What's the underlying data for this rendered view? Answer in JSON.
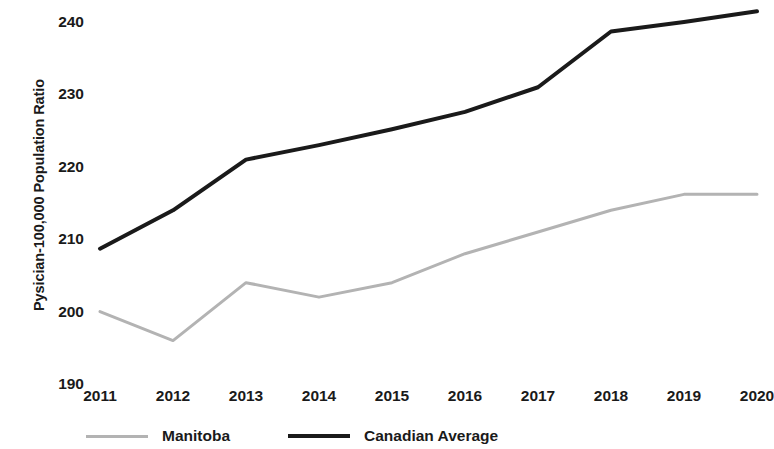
{
  "chart_data": {
    "type": "line",
    "title": "",
    "subtitle": "",
    "xlabel": "",
    "ylabel": "Pysician-100,000 Population Ratio",
    "categories": [
      "2011",
      "2012",
      "2013",
      "2014",
      "2015",
      "2016",
      "2017",
      "2018",
      "2019",
      "2020"
    ],
    "x": [
      2011,
      2012,
      2013,
      2014,
      2015,
      2016,
      2017,
      2018,
      2019,
      2020
    ],
    "series": [
      {
        "name": "Manitoba",
        "color": "#b3b3b3",
        "values": [
          200.0,
          196.0,
          204.0,
          202.0,
          204.0,
          208.0,
          211.0,
          214.0,
          216.2,
          216.2
        ]
      },
      {
        "name": "Canadian Average",
        "color": "#1a1a1a",
        "values": [
          208.7,
          214.0,
          221.0,
          223.0,
          225.2,
          227.6,
          231.0,
          238.7,
          240.0,
          241.5
        ]
      }
    ],
    "ylim": [
      190,
      242.5
    ],
    "yticks": [
      190,
      200,
      210,
      220,
      230,
      240
    ],
    "ytick_labels": [
      "190",
      "200",
      "210",
      "220",
      "230",
      "240"
    ],
    "grid": false,
    "legend_position": "bottom-left",
    "legend": [
      "Manitoba",
      "Canadian Average"
    ]
  }
}
